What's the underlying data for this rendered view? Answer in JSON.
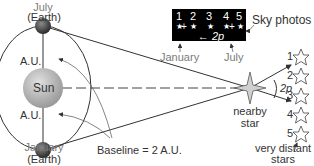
{
  "diagram": {
    "earth_top": {
      "month": "July",
      "sub": "(Earth)"
    },
    "earth_bottom": {
      "month": "January",
      "sub": "(Earth)"
    },
    "au_top": "A.U.",
    "au_bottom": "A.U.",
    "sun": "Sun",
    "baseline": "Baseline = 2 A.U.",
    "nearby_star": {
      "line1": "nearby",
      "line2": "star"
    },
    "angle_label": "2p",
    "distant_stars": {
      "line1": "very distant",
      "line2": "stars",
      "numbers": [
        "1",
        "2",
        "3",
        "4",
        "5"
      ]
    },
    "sky_photos": {
      "label": "Sky photos",
      "numbers": [
        "1",
        "2",
        "3",
        "4",
        "5"
      ],
      "separation": "2p",
      "january": "January",
      "july": "July"
    },
    "colors": {
      "sun": "#b5b5b5",
      "earth": "#4a4a4a",
      "lines": "#333333",
      "photo_bg": "#000000"
    }
  }
}
